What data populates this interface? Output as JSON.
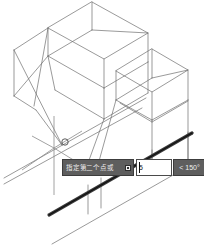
{
  "app": {
    "title": "AutoCAD isometric drawing viewport",
    "background_color": "#ffffff"
  },
  "viewport": {
    "name": "model-space-viewport",
    "geometry_line_color": "#6e6e6e",
    "highlight_line_color": "#333333",
    "crosshair_color": "#8a8a8a"
  },
  "dynamic_input": {
    "prompt_label": "指定第二个点或",
    "dropdown_icon": "caret-down-icon",
    "distance_value": "5",
    "distance_placeholder": "",
    "angle_symbol": "<",
    "angle_value": "150°",
    "angle_full": "< 150°",
    "prompt_bg_color": "#5e5e5e",
    "input_bg_color": "#ffffff",
    "text_color": "#ededed"
  },
  "cursor": {
    "name": "crosshair-cursor",
    "osnap_marker": "node-circle-marker",
    "x": 64,
    "y": 148
  }
}
